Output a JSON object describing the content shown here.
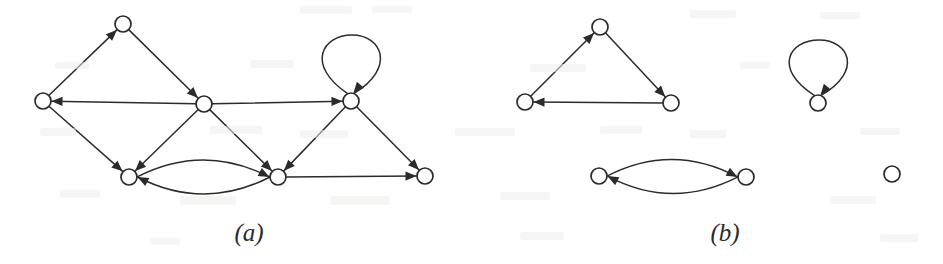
{
  "figure": {
    "width": 943,
    "height": 264,
    "background_color": "#ffffff",
    "ink_color": "#2b2b2b",
    "node_radius": 8,
    "node_fill": "#ffffff",
    "caption_a": "(a)",
    "caption_b": "(b)"
  },
  "captions": [
    {
      "id": "caption-a",
      "text": "(a)",
      "x": 249,
      "y": 233
    },
    {
      "id": "caption-b",
      "text": "(b)",
      "x": 725,
      "y": 233
    }
  ],
  "panels": [
    {
      "id": "panel-a",
      "label": "(a)",
      "description": "directed graph",
      "nodes": [
        {
          "id": "a-top",
          "x": 123,
          "y": 24,
          "r": 8
        },
        {
          "id": "a-left",
          "x": 43,
          "y": 101,
          "r": 8
        },
        {
          "id": "a-mid",
          "x": 204,
          "y": 104,
          "r": 8
        },
        {
          "id": "a-right",
          "x": 351,
          "y": 101,
          "r": 8
        },
        {
          "id": "a-bl",
          "x": 129,
          "y": 177,
          "r": 8
        },
        {
          "id": "a-bm",
          "x": 278,
          "y": 177,
          "r": 8
        },
        {
          "id": "a-br",
          "x": 425,
          "y": 176,
          "r": 8
        }
      ],
      "edges": [
        {
          "id": "a-e1",
          "from": "a-left",
          "to": "a-top",
          "type": "straight",
          "curve": 0
        },
        {
          "id": "a-e2",
          "from": "a-top",
          "to": "a-mid",
          "type": "straight",
          "curve": 0
        },
        {
          "id": "a-e3",
          "from": "a-mid",
          "to": "a-left",
          "type": "straight",
          "curve": 0
        },
        {
          "id": "a-e4",
          "from": "a-mid",
          "to": "a-right",
          "type": "straight",
          "curve": 0
        },
        {
          "id": "a-e5",
          "from": "a-right",
          "to": "a-right",
          "type": "selfloop",
          "loop_height": 66,
          "loop_width": 46
        },
        {
          "id": "a-e6",
          "from": "a-left",
          "to": "a-bl",
          "type": "straight",
          "curve": 0
        },
        {
          "id": "a-e7",
          "from": "a-mid",
          "to": "a-bl",
          "type": "straight",
          "curve": 0
        },
        {
          "id": "a-e8",
          "from": "a-mid",
          "to": "a-bm",
          "type": "straight",
          "curve": 0
        },
        {
          "id": "a-e9",
          "from": "a-right",
          "to": "a-bm",
          "type": "straight",
          "curve": 0
        },
        {
          "id": "a-e10",
          "from": "a-right",
          "to": "a-br",
          "type": "straight",
          "curve": 0
        },
        {
          "id": "a-e11",
          "from": "a-bl",
          "to": "a-bm",
          "type": "curved",
          "curve": -17
        },
        {
          "id": "a-e12",
          "from": "a-bm",
          "to": "a-bl",
          "type": "curved",
          "curve": -17
        },
        {
          "id": "a-e13",
          "from": "a-bm",
          "to": "a-br",
          "type": "straight",
          "curve": 0
        }
      ]
    },
    {
      "id": "panel-b",
      "label": "(b)",
      "description": "strongly connected components",
      "nodes": [
        {
          "id": "b-top",
          "x": 600,
          "y": 27,
          "r": 8
        },
        {
          "id": "b-left",
          "x": 525,
          "y": 102,
          "r": 8
        },
        {
          "id": "b-right",
          "x": 671,
          "y": 103,
          "r": 8
        },
        {
          "id": "b-loop",
          "x": 818,
          "y": 103,
          "r": 8
        },
        {
          "id": "b-bl",
          "x": 599,
          "y": 176,
          "r": 8
        },
        {
          "id": "b-br",
          "x": 746,
          "y": 177,
          "r": 8
        },
        {
          "id": "b-iso",
          "x": 892,
          "y": 174,
          "r": 8
        }
      ],
      "edges": [
        {
          "id": "b-e1",
          "from": "b-left",
          "to": "b-top",
          "type": "straight",
          "curve": 0
        },
        {
          "id": "b-e2",
          "from": "b-top",
          "to": "b-right",
          "type": "straight",
          "curve": 0
        },
        {
          "id": "b-e3",
          "from": "b-right",
          "to": "b-left",
          "type": "straight",
          "curve": 0
        },
        {
          "id": "b-e4",
          "from": "b-loop",
          "to": "b-loop",
          "type": "selfloop",
          "loop_height": 63,
          "loop_width": 46
        },
        {
          "id": "b-e5",
          "from": "b-bl",
          "to": "b-br",
          "type": "curved",
          "curve": -17
        },
        {
          "id": "b-e6",
          "from": "b-br",
          "to": "b-bl",
          "type": "curved",
          "curve": -17
        }
      ]
    }
  ]
}
